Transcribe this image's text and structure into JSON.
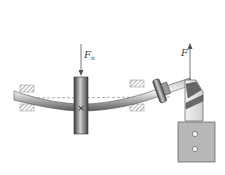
{
  "diagram": {
    "title": "",
    "labels": {
      "gear_force": "F",
      "gear_force_sub": "n",
      "end_force": "F"
    },
    "components": [
      {
        "name": "left-bearing",
        "type": "bearing-support"
      },
      {
        "name": "gear",
        "type": "gear",
        "marker": "×"
      },
      {
        "name": "right-bearing",
        "type": "bearing-support"
      },
      {
        "name": "shaft",
        "type": "bent-shaft",
        "neutral_axis": "dashed"
      },
      {
        "name": "coupling",
        "type": "flange-coupling"
      },
      {
        "name": "drive-head",
        "type": "helical-joint"
      },
      {
        "name": "motor-block",
        "type": "housing",
        "holes": 2
      }
    ],
    "colors": {
      "hatch": "#666666",
      "shaft_light": "#e8e8e8",
      "shaft_dark": "#555555",
      "housing": "#b5b5b5",
      "line": "#444444"
    }
  }
}
